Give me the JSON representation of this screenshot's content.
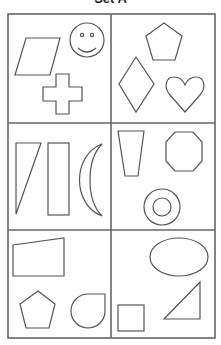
{
  "title": "Set A",
  "grid": {
    "rows": 3,
    "columns": 2
  },
  "cells": [
    {
      "position": "row1-left",
      "shapes": [
        "parallelogram",
        "smiley-face",
        "cross"
      ]
    },
    {
      "position": "row1-right",
      "shapes": [
        "pentagon",
        "rhombus",
        "heart"
      ]
    },
    {
      "position": "row2-left",
      "shapes": [
        "right-triangle",
        "rectangle",
        "crescent"
      ]
    },
    {
      "position": "row2-right",
      "shapes": [
        "trapezoid",
        "octagon",
        "ring"
      ]
    },
    {
      "position": "row3-left",
      "shapes": [
        "quadrilateral",
        "pentagon",
        "teardrop"
      ]
    },
    {
      "position": "row3-right",
      "shapes": [
        "ellipse",
        "square",
        "right-triangle"
      ]
    }
  ],
  "colors": {
    "stroke": "#555555",
    "background": "#ffffff"
  }
}
